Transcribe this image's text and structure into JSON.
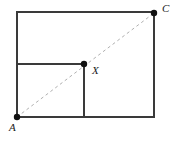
{
  "figure": {
    "kind": "geometry-diagram",
    "background_color": "#ffffff",
    "stroke_color": "#3a3a3a",
    "dash_color": "#b0b0b0",
    "dot_color": "#111111",
    "stroke_width": 2,
    "dash_width": 1,
    "dash_pattern": "3 3",
    "dot_radius": 3.2,
    "canvas": {
      "width": 178,
      "height": 142
    },
    "outer_rectangle": {
      "name": "outer-rectangle",
      "x": 17,
      "y": 12,
      "width": 137,
      "height": 105
    },
    "inner_horizontal_segment": {
      "name": "inner-horizontal-segment",
      "x1": 17,
      "y1": 64,
      "x2": 84,
      "y2": 64
    },
    "inner_vertical_segment": {
      "name": "inner-vertical-segment",
      "x1": 84,
      "y1": 64,
      "x2": 84,
      "y2": 117
    },
    "diagonal": {
      "name": "diagonal-AC",
      "x1": 17,
      "y1": 117,
      "x2": 154,
      "y2": 13,
      "style": "dashed"
    },
    "points": [
      {
        "id": "A",
        "label": "A",
        "x": 17,
        "y": 117,
        "label_x": 9,
        "label_y": 128
      },
      {
        "id": "X",
        "label": "X",
        "x": 84,
        "y": 64,
        "label_x": 92,
        "label_y": 71
      },
      {
        "id": "C",
        "label": "C",
        "x": 154,
        "y": 13,
        "label_x": 162,
        "label_y": 9
      }
    ]
  }
}
